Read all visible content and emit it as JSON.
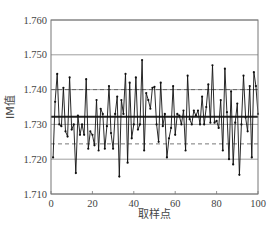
{
  "chart_data": {
    "type": "line",
    "title": "",
    "xlabel": "取样点",
    "ylabel": "IM值",
    "xlim": [
      0,
      100
    ],
    "ylim": [
      1.71,
      1.76
    ],
    "x_ticks": [
      "0",
      "20",
      "40",
      "60",
      "80",
      "100"
    ],
    "y_ticks": [
      "1.710",
      "1.720",
      "1.730",
      "1.740",
      "1.750",
      "1.760"
    ],
    "grid": "horizontal",
    "legend": null,
    "reference_lines": [
      {
        "name": "center_line",
        "value": 1.7322,
        "style": "thick-solid"
      },
      {
        "name": "upper_limit",
        "value": 1.74,
        "style": "dashed"
      },
      {
        "name": "lower_limit",
        "value": 1.7244,
        "style": "dashed"
      }
    ],
    "series": [
      {
        "name": "IM值",
        "x": [
          1,
          2,
          3,
          4,
          5,
          6,
          7,
          8,
          9,
          10,
          11,
          12,
          13,
          14,
          15,
          16,
          17,
          18,
          19,
          20,
          21,
          22,
          23,
          24,
          25,
          26,
          27,
          28,
          29,
          30,
          31,
          32,
          33,
          34,
          35,
          36,
          37,
          38,
          39,
          40,
          41,
          42,
          43,
          44,
          45,
          46,
          47,
          48,
          49,
          50,
          51,
          52,
          53,
          54,
          55,
          56,
          57,
          58,
          59,
          60,
          61,
          62,
          63,
          64,
          65,
          66,
          67,
          68,
          69,
          70,
          71,
          72,
          73,
          74,
          75,
          76,
          77,
          78,
          79,
          80,
          81,
          82,
          83,
          84,
          85,
          86,
          87,
          88,
          89,
          90,
          91,
          92,
          93,
          94,
          95,
          96,
          97,
          98,
          99,
          100
        ],
        "values": [
          1.7205,
          1.7365,
          1.7445,
          1.73,
          1.7295,
          1.7405,
          1.728,
          1.7265,
          1.7435,
          1.7285,
          1.73,
          1.716,
          1.7325,
          1.727,
          1.73,
          1.727,
          1.743,
          1.723,
          1.728,
          1.727,
          1.724,
          1.737,
          1.7225,
          1.7345,
          1.733,
          1.723,
          1.7295,
          1.741,
          1.7275,
          1.723,
          1.733,
          1.738,
          1.715,
          1.737,
          1.733,
          1.7445,
          1.719,
          1.742,
          1.726,
          1.73,
          1.7435,
          1.7285,
          1.73,
          1.7485,
          1.7225,
          1.739,
          1.737,
          1.7345,
          1.7405,
          1.7408,
          1.73,
          1.725,
          1.742,
          1.7295,
          1.733,
          1.7205,
          1.726,
          1.729,
          1.741,
          1.727,
          1.733,
          1.7325,
          1.73,
          1.734,
          1.7225,
          1.744,
          1.7315,
          1.73,
          1.734,
          1.7325,
          1.734,
          1.73,
          1.738,
          1.73,
          1.735,
          1.7415,
          1.7305,
          1.747,
          1.7305,
          1.731,
          1.729,
          1.737,
          1.7225,
          1.746,
          1.7335,
          1.72,
          1.7395,
          1.7185,
          1.7305,
          1.736,
          1.7155,
          1.73,
          1.744,
          1.732,
          1.728,
          1.741,
          1.7205,
          1.745,
          1.741,
          1.733
        ]
      }
    ]
  }
}
